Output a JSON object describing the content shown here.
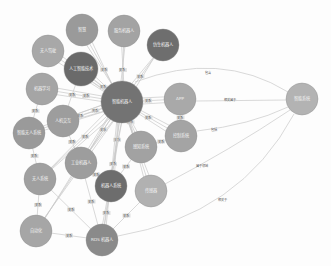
{
  "graph": {
    "nodes": [
      {
        "id": "n0",
        "label": "智能机器人",
        "x": 122,
        "y": 102,
        "r": 21,
        "color": "#737373"
      },
      {
        "id": "n1",
        "label": "智慧",
        "x": 82,
        "y": 30,
        "r": 16,
        "color": "#9a9a9a"
      },
      {
        "id": "n2",
        "label": "服务机器人",
        "x": 124,
        "y": 31,
        "r": 16,
        "color": "#a3a3a3"
      },
      {
        "id": "n3",
        "label": "仿生机器人",
        "x": 163,
        "y": 45,
        "r": 16,
        "color": "#6e6e6e"
      },
      {
        "id": "n4",
        "label": "无人驾驶",
        "x": 48,
        "y": 51,
        "r": 16,
        "color": "#a8a8a8"
      },
      {
        "id": "n5",
        "label": "人工智能技术",
        "x": 81,
        "y": 69,
        "r": 17,
        "color": "#6a6a6a"
      },
      {
        "id": "n6",
        "label": "机器学习",
        "x": 42,
        "y": 89,
        "r": 16,
        "color": "#a5a5a5"
      },
      {
        "id": "n7",
        "label": "人机交互",
        "x": 63,
        "y": 121,
        "r": 16,
        "color": "#9d9d9d"
      },
      {
        "id": "n8",
        "label": "智能无人系统",
        "x": 29,
        "y": 133,
        "r": 16,
        "color": "#9a9a9a"
      },
      {
        "id": "n9",
        "label": "APP",
        "x": 180,
        "y": 99,
        "r": 16,
        "color": "#a9a9a9"
      },
      {
        "id": "n10",
        "label": "控制系统",
        "x": 181,
        "y": 136,
        "r": 16,
        "color": "#a4a4a4"
      },
      {
        "id": "n11",
        "label": "工业机器人",
        "x": 81,
        "y": 163,
        "r": 16,
        "color": "#9d9d9d"
      },
      {
        "id": "n12",
        "label": "感知系统",
        "x": 141,
        "y": 147,
        "r": 16,
        "color": "#a2a2a2"
      },
      {
        "id": "n13",
        "label": "无人系统",
        "x": 40,
        "y": 179,
        "r": 16,
        "color": "#a0a0a0"
      },
      {
        "id": "n14",
        "label": "机器人系统",
        "x": 111,
        "y": 186,
        "r": 16,
        "color": "#6d6d6d"
      },
      {
        "id": "n15",
        "label": "传感器",
        "x": 151,
        "y": 191,
        "r": 16,
        "color": "#b1b1b1"
      },
      {
        "id": "n16",
        "label": "自动化",
        "x": 36,
        "y": 231,
        "r": 16,
        "color": "#a6a6a6"
      },
      {
        "id": "n17",
        "label": "ROS 机器人",
        "x": 102,
        "y": 240,
        "r": 16,
        "color": "#8a8a8a"
      },
      {
        "id": "n18",
        "label": "智能系统",
        "x": 302,
        "y": 99,
        "r": 16,
        "color": "#b3b3b3"
      }
    ],
    "long_edges": [
      {
        "from": "n0",
        "to": "n18",
        "label": "包含",
        "path": "M 135 82 Q 220 50 288 92",
        "lx": 205,
        "ly": 74
      },
      {
        "from": "n9",
        "to": "n18",
        "label": "相关属于",
        "path": "M 196 101 L 286 100",
        "lx": 224,
        "ly": 101
      },
      {
        "from": "n10",
        "to": "n18",
        "label": "包括",
        "path": "M 197 131 Q 250 125 288 107",
        "lx": 211,
        "ly": 131
      },
      {
        "from": "n15",
        "to": "n18",
        "label": "属于领域",
        "path": "M 165 184 Q 230 150 290 110",
        "lx": 196,
        "ly": 167
      },
      {
        "from": "n17",
        "to": "n18",
        "label": "相关于",
        "path": "M 118 236 Q 240 215 294 114",
        "lx": 218,
        "ly": 201
      }
    ],
    "hub_edge_label": "关系"
  }
}
